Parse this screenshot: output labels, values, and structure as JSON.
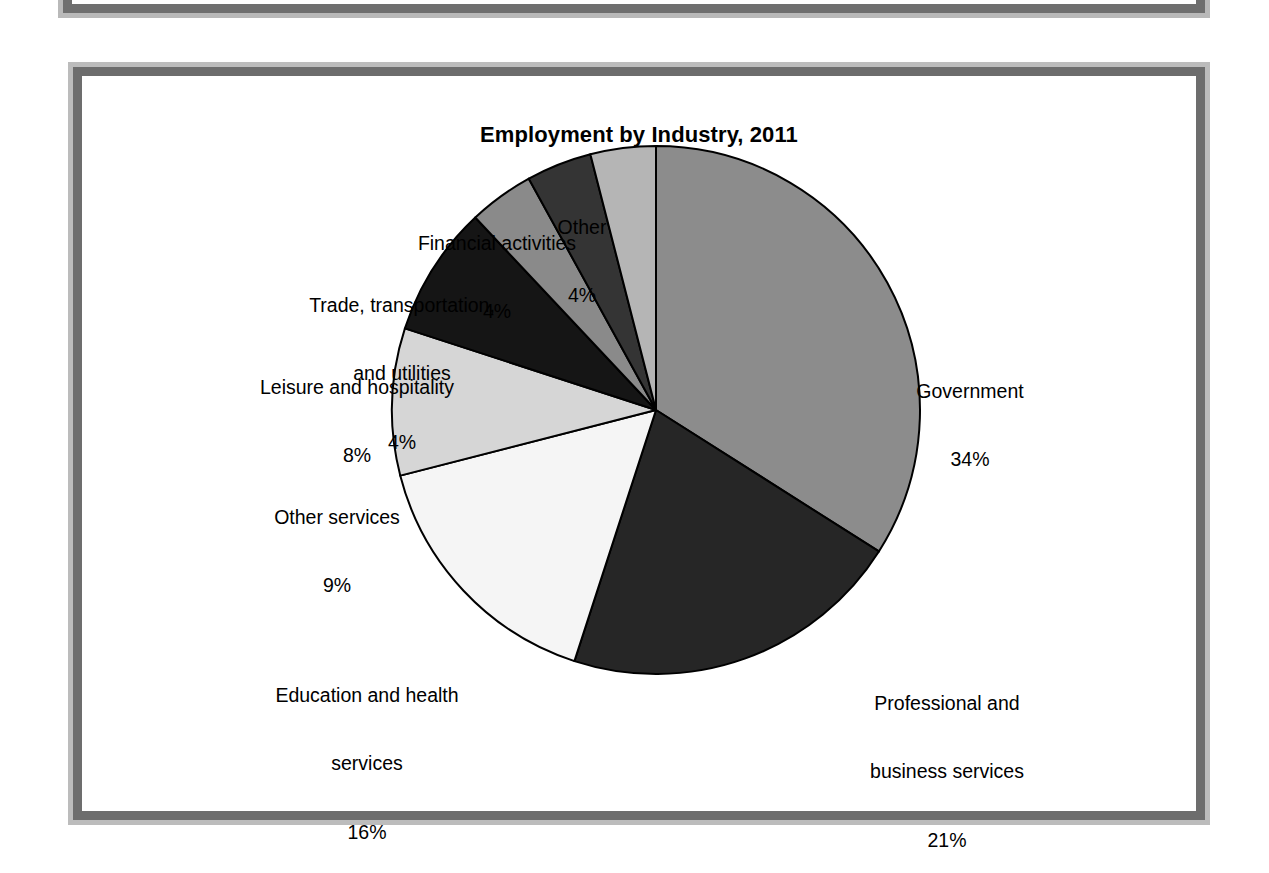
{
  "figure": {
    "title": "Employment by Industry, 2011"
  },
  "chart_data": {
    "type": "pie",
    "title": "Employment by Industry, 2011",
    "xlabel": "",
    "ylabel": "",
    "legend_position": "none",
    "grid": false,
    "start_angle_deg": 0,
    "direction": "clockwise",
    "units": "percent",
    "categories": [
      "Government",
      "Professional and business services",
      "Education and health services",
      "Other services",
      "Leisure and hospitality",
      "Trade, transportation, and utilities",
      "Financial activities",
      "Other"
    ],
    "values": [
      34,
      21,
      16,
      9,
      8,
      4,
      4,
      4
    ],
    "value_labels": [
      "34%",
      "21%",
      "16%",
      "9%",
      "8%",
      "4%",
      "4%",
      "4%"
    ],
    "slice_colors": [
      "#8c8c8c",
      "#262626",
      "#f5f5f5",
      "#d6d6d6",
      "#151515",
      "#8a8a8a",
      "#343434",
      "#b5b5b5"
    ],
    "slice_edge_color": "#000000",
    "slices": [
      {
        "label": "Government",
        "pct_text": "34%",
        "value": 34,
        "color": "#8c8c8c"
      },
      {
        "label_line1": "Professional and",
        "label_line2": "business services",
        "pct_text": "21%",
        "value": 21,
        "color": "#262626"
      },
      {
        "label_line1": "Education and health",
        "label_line2": "services",
        "pct_text": "16%",
        "value": 16,
        "color": "#f5f5f5"
      },
      {
        "label": "Other services",
        "pct_text": "9%",
        "value": 9,
        "color": "#d6d6d6"
      },
      {
        "label": "Leisure and hospitality",
        "pct_text": "8%",
        "value": 8,
        "color": "#151515"
      },
      {
        "label_line1": "Trade, transportation,",
        "label_line2": "and utilities",
        "pct_text": "4%",
        "value": 4,
        "color": "#8a8a8a"
      },
      {
        "label": "Financial activities",
        "pct_text": "4%",
        "value": 4,
        "color": "#343434"
      },
      {
        "label": "Other",
        "pct_text": "4%",
        "value": 4,
        "color": "#b5b5b5"
      }
    ]
  },
  "labels": {
    "government": {
      "name": "Government",
      "pct": "34%"
    },
    "professional": {
      "line1": "Professional and",
      "line2": "business services",
      "pct": "21%"
    },
    "education": {
      "line1": "Education and health",
      "line2": "services",
      "pct": "16%"
    },
    "other_services": {
      "name": "Other services",
      "pct": "9%"
    },
    "leisure": {
      "name": "Leisure and hospitality",
      "pct": "8%"
    },
    "trade": {
      "line1": "Trade, transportation,",
      "line2": "and utilities",
      "pct": "4%"
    },
    "financial": {
      "name": "Financial activities",
      "pct": "4%"
    },
    "other": {
      "name": "Other",
      "pct": "4%"
    }
  },
  "colors": {
    "frame_outer": "#bcbcbc",
    "frame_inner": "#6d6d6d",
    "page_background": "#ffffff",
    "text": "#000000"
  }
}
